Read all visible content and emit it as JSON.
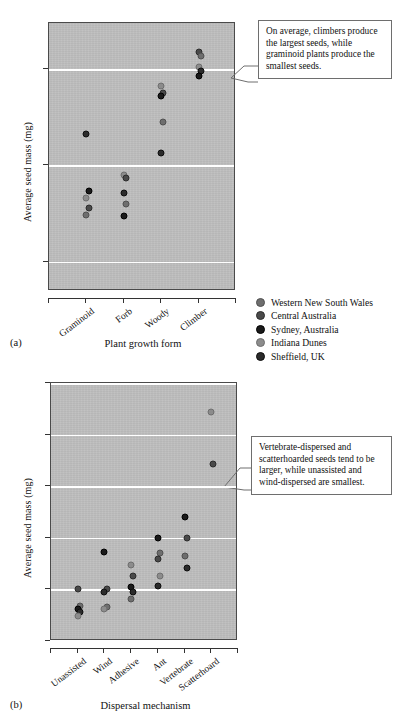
{
  "figure": {
    "panel_a_tag": "(a)",
    "panel_b_tag": "(b)"
  },
  "series_colors": {
    "western_new_south_wales": "#6e6e6e",
    "central_australia": "#4a4a4a",
    "sydney_australia": "#1a1a1a",
    "indiana_dunes": "#8c8c8c",
    "sheffield_uk": "#2b2b2b"
  },
  "legend": {
    "items": [
      {
        "label": "Western New South Wales",
        "key": "western_new_south_wales"
      },
      {
        "label": "Central Australia",
        "key": "central_australia"
      },
      {
        "label": "Sydney, Australia",
        "key": "sydney_australia"
      },
      {
        "label": "Indiana Dunes",
        "key": "indiana_dunes"
      },
      {
        "label": "Sheffield, UK",
        "key": "sheffield_uk"
      }
    ]
  },
  "annotations": {
    "panel_a": "On average, climbers produce the largest seeds, while graminoid plants produce the smallest seeds.",
    "panel_b": "Vertebrate-dispersed and scatterhoarded seeds tend to be larger, while unassisted and wind-dispersed are smallest."
  },
  "chart_data": [
    {
      "id": "panel_a",
      "type": "scatter",
      "title": "",
      "xlabel": "Plant growth form",
      "ylabel": "Average seed mass (mg)",
      "yscale": "log",
      "ylim": [
        0.05,
        30
      ],
      "ytick_values": [
        10,
        1,
        0.1
      ],
      "ytick_labels": [
        "10",
        "1",
        "0.1"
      ],
      "grid": "horizontal-white",
      "categories": [
        "Graminoid",
        "Forb",
        "Woody",
        "Climber"
      ],
      "legend_position": "right-below",
      "points": [
        {
          "category": "Graminoid",
          "series": "Sydney, Australia",
          "key": "sydney_australia",
          "value": 0.55
        },
        {
          "category": "Graminoid",
          "series": "Indiana Dunes",
          "key": "indiana_dunes",
          "value": 0.46
        },
        {
          "category": "Graminoid",
          "series": "Central Australia",
          "key": "central_australia",
          "value": 0.36
        },
        {
          "category": "Graminoid",
          "series": "Western New South Wales",
          "key": "western_new_south_wales",
          "value": 0.31
        },
        {
          "category": "Graminoid",
          "series": "Sheffield, UK",
          "key": "sheffield_uk",
          "value": 2.1
        },
        {
          "category": "Forb",
          "series": "Indiana Dunes",
          "key": "indiana_dunes",
          "value": 0.8
        },
        {
          "category": "Forb",
          "series": "Central Australia",
          "key": "central_australia",
          "value": 0.74
        },
        {
          "category": "Forb",
          "series": "Sheffield, UK",
          "key": "sheffield_uk",
          "value": 0.52
        },
        {
          "category": "Forb",
          "series": "Western New South Wales",
          "key": "western_new_south_wales",
          "value": 0.4
        },
        {
          "category": "Forb",
          "series": "Sydney, Australia",
          "key": "sydney_australia",
          "value": 0.3
        },
        {
          "category": "Woody",
          "series": "Indiana Dunes",
          "key": "indiana_dunes",
          "value": 6.6
        },
        {
          "category": "Woody",
          "series": "Central Australia",
          "key": "central_australia",
          "value": 5.6
        },
        {
          "category": "Woody",
          "series": "Sydney, Australia",
          "key": "sydney_australia",
          "value": 5.2
        },
        {
          "category": "Woody",
          "series": "Western New South Wales",
          "key": "western_new_south_wales",
          "value": 2.8
        },
        {
          "category": "Woody",
          "series": "Sheffield, UK",
          "key": "sheffield_uk",
          "value": 1.35
        },
        {
          "category": "Climber",
          "series": "Central Australia",
          "key": "central_australia",
          "value": 15.0
        },
        {
          "category": "Climber",
          "series": "Western New South Wales",
          "key": "western_new_south_wales",
          "value": 13.5
        },
        {
          "category": "Climber",
          "series": "Indiana Dunes",
          "key": "indiana_dunes",
          "value": 10.5
        },
        {
          "category": "Climber",
          "series": "Sheffield, UK",
          "key": "sheffield_uk",
          "value": 9.6
        },
        {
          "category": "Climber",
          "series": "Sydney, Australia",
          "key": "sydney_australia",
          "value": 8.4
        }
      ]
    },
    {
      "id": "panel_b",
      "type": "scatter",
      "title": "",
      "xlabel": "Dispersal mechanism",
      "ylabel": "Average seed mass (mg)",
      "yscale": "log",
      "ylim": [
        0.1,
        10000
      ],
      "ytick_values": [
        10000,
        1000,
        100,
        10,
        1,
        0.1
      ],
      "ytick_labels": [
        "10⁴",
        "10³",
        "10²",
        "10¹",
        "10⁰",
        "10⁻¹"
      ],
      "grid": "horizontal-white",
      "categories": [
        "Unassisted",
        "Wind",
        "Adhesive",
        "Ant",
        "Vertebrate",
        "Scatterhoard"
      ],
      "legend_position": "shared-with-panel-a",
      "points": [
        {
          "category": "Unassisted",
          "series": "Central Australia",
          "key": "central_australia",
          "value": 1.0
        },
        {
          "category": "Unassisted",
          "series": "Western New South Wales",
          "key": "western_new_south_wales",
          "value": 0.47
        },
        {
          "category": "Unassisted",
          "series": "Sydney, Australia",
          "key": "sydney_australia",
          "value": 0.42
        },
        {
          "category": "Unassisted",
          "series": "Sheffield, UK",
          "key": "sheffield_uk",
          "value": 0.37
        },
        {
          "category": "Unassisted",
          "series": "Indiana Dunes",
          "key": "indiana_dunes",
          "value": 0.31
        },
        {
          "category": "Wind",
          "series": "Sydney, Australia",
          "key": "sydney_australia",
          "value": 5.4
        },
        {
          "category": "Wind",
          "series": "Central Australia",
          "key": "central_australia",
          "value": 1.0
        },
        {
          "category": "Wind",
          "series": "Sheffield, UK",
          "key": "sheffield_uk",
          "value": 0.88
        },
        {
          "category": "Wind",
          "series": "Western New South Wales",
          "key": "western_new_south_wales",
          "value": 0.46
        },
        {
          "category": "Wind",
          "series": "Indiana Dunes",
          "key": "indiana_dunes",
          "value": 0.42
        },
        {
          "category": "Adhesive",
          "series": "Indiana Dunes",
          "key": "indiana_dunes",
          "value": 3.0
        },
        {
          "category": "Adhesive",
          "series": "Central Australia",
          "key": "central_australia",
          "value": 1.8
        },
        {
          "category": "Adhesive",
          "series": "Sydney, Australia",
          "key": "sydney_australia",
          "value": 1.1
        },
        {
          "category": "Adhesive",
          "series": "Sheffield, UK",
          "key": "sheffield_uk",
          "value": 0.9
        },
        {
          "category": "Adhesive",
          "series": "Western New South Wales",
          "key": "western_new_south_wales",
          "value": 0.65
        },
        {
          "category": "Ant",
          "series": "Sydney, Australia",
          "key": "sydney_australia",
          "value": 10.0
        },
        {
          "category": "Ant",
          "series": "Western New South Wales",
          "key": "western_new_south_wales",
          "value": 5.0
        },
        {
          "category": "Ant",
          "series": "Central Australia",
          "key": "central_australia",
          "value": 3.9
        },
        {
          "category": "Ant",
          "series": "Indiana Dunes",
          "key": "indiana_dunes",
          "value": 1.8
        },
        {
          "category": "Ant",
          "series": "Sheffield, UK",
          "key": "sheffield_uk",
          "value": 1.15
        },
        {
          "category": "Vertebrate",
          "series": "Sydney, Australia",
          "key": "sydney_australia",
          "value": 25.0
        },
        {
          "category": "Vertebrate",
          "series": "Central Australia",
          "key": "central_australia",
          "value": 10.0
        },
        {
          "category": "Vertebrate",
          "series": "Western New South Wales",
          "key": "western_new_south_wales",
          "value": 4.4
        },
        {
          "category": "Vertebrate",
          "series": "Sheffield, UK",
          "key": "sheffield_uk",
          "value": 2.6
        },
        {
          "category": "Scatterhoard",
          "series": "Indiana Dunes",
          "key": "indiana_dunes",
          "value": 2700
        },
        {
          "category": "Scatterhoard",
          "series": "Central Australia",
          "key": "central_australia",
          "value": 270
        }
      ]
    }
  ]
}
